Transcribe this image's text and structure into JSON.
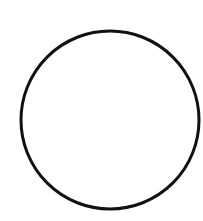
{
  "canvas": {
    "width": 203,
    "height": 221,
    "background": "#ffffff"
  },
  "shapes": [
    {
      "type": "circle",
      "cx": 110,
      "cy": 120,
      "r": 89,
      "stroke": "#111111",
      "stroke_width": 3,
      "fill": "none"
    }
  ]
}
